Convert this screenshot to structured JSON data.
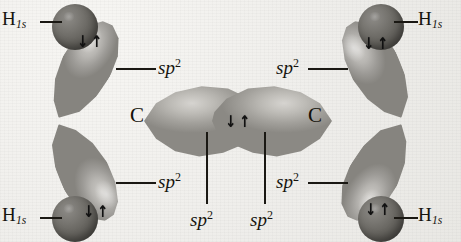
{
  "figure": {
    "background_color": "#f2f1ee",
    "lobe_color": "#b7b5b1",
    "sphere_color": "#5f5d58",
    "label_color": "#16140f"
  },
  "atoms": [
    {
      "id": "carbon-left",
      "label": "C",
      "x": 136,
      "y": 113
    },
    {
      "id": "carbon-right",
      "label": "C",
      "x": 312,
      "y": 113
    }
  ],
  "hydrogens": [
    {
      "id": "h-top-left",
      "label": "H",
      "subscript": "1s",
      "sphere_x": 52,
      "sphere_y": 4,
      "label_x": 2,
      "label_y": 8,
      "leader_x": 40,
      "leader_y": 21,
      "leader_w": 22
    },
    {
      "id": "h-top-right",
      "label": "H",
      "subscript": "1s",
      "sphere_x": 358,
      "sphere_y": 4,
      "label_x": 418,
      "label_y": 8,
      "leader_x": 394,
      "leader_y": 21,
      "leader_w": 24
    },
    {
      "id": "h-bottom-left",
      "label": "H",
      "subscript": "1s",
      "sphere_x": 52,
      "sphere_y": 196,
      "label_x": 2,
      "label_y": 204,
      "leader_x": 40,
      "leader_y": 217,
      "leader_w": 22
    },
    {
      "id": "h-bottom-right",
      "label": "H",
      "subscript": "1s",
      "sphere_x": 358,
      "sphere_y": 196,
      "label_x": 418,
      "label_y": 204,
      "leader_x": 394,
      "leader_y": 217,
      "leader_w": 24
    }
  ],
  "orbital_labels": [
    {
      "id": "sp2-top-left",
      "text": "sp",
      "superscript": "2",
      "x": 158,
      "y": 56,
      "leader_x": 116,
      "leader_y": 68,
      "leader_w": 40,
      "orientation": "horizontal"
    },
    {
      "id": "sp2-top-right",
      "text": "sp",
      "superscript": "2",
      "x": 276,
      "y": 56,
      "leader_x": 308,
      "leader_y": 68,
      "leader_w": 40,
      "orientation": "horizontal"
    },
    {
      "id": "sp2-bottom-left",
      "text": "sp",
      "superscript": "2",
      "x": 158,
      "y": 170,
      "leader_x": 116,
      "leader_y": 182,
      "leader_w": 40,
      "orientation": "horizontal"
    },
    {
      "id": "sp2-bottom-right",
      "text": "sp",
      "superscript": "2",
      "x": 276,
      "y": 170,
      "leader_x": 308,
      "leader_y": 182,
      "leader_w": 40,
      "orientation": "horizontal"
    },
    {
      "id": "sp2-center-left",
      "text": "sp",
      "superscript": "2",
      "x": 190,
      "y": 208,
      "leader_x": 206,
      "leader_y": 132,
      "leader_h": 72,
      "orientation": "vertical"
    },
    {
      "id": "sp2-center-right",
      "text": "sp",
      "superscript": "2",
      "x": 250,
      "y": 208,
      "leader_x": 264,
      "leader_y": 132,
      "leader_h": 72,
      "orientation": "vertical"
    }
  ],
  "electron_pairs": [
    {
      "id": "epair-top-left",
      "symbol_down": "↓",
      "symbol_up": "↑",
      "x": 76,
      "y": 34
    },
    {
      "id": "epair-top-right",
      "symbol_down": "↓",
      "symbol_up": "↑",
      "x": 362,
      "y": 36
    },
    {
      "id": "epair-center",
      "symbol_down": "↓",
      "symbol_up": "↑",
      "x": 224,
      "y": 114
    },
    {
      "id": "epair-bottom-left",
      "symbol_down": "↓",
      "symbol_up": "↑",
      "x": 82,
      "y": 204
    },
    {
      "id": "epair-bottom-right",
      "symbol_down": "↓",
      "symbol_up": "↑",
      "x": 364,
      "y": 202
    }
  ]
}
